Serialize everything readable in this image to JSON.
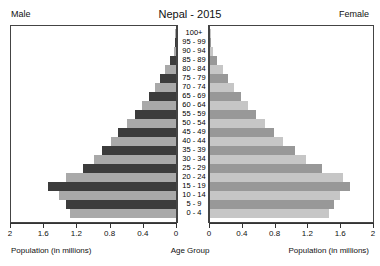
{
  "header": {
    "title": "Nepal - 2015",
    "male_label": "Male",
    "female_label": "Female"
  },
  "axis": {
    "left_title": "Population (in millions)",
    "center_title": "Age Group",
    "right_title": "Population (in millions)",
    "ticks": [
      "2",
      "1.6",
      "1.2",
      "0.8",
      "0.4",
      "0"
    ],
    "ticks_right": [
      "0",
      "0.4",
      "0.8",
      "1.2",
      "1.6",
      "2"
    ]
  },
  "colors": {
    "male_dark": "#3c3c3c",
    "male_light": "#a9a9a9",
    "female_dark": "#989898",
    "female_light": "#c6c6c6",
    "frame": "#444444",
    "background": "#ffffff"
  },
  "chart_data": {
    "type": "bar",
    "title": "Nepal - 2015",
    "subtitle": "",
    "xlabel": "Population (in millions)",
    "ylabel": "Age Group",
    "xlim": [
      0,
      2
    ],
    "grid": false,
    "legend": [
      "Male",
      "Female"
    ],
    "legend_position": "top-left and top-right",
    "orientation": "horizontal-pyramid",
    "categories": [
      "100+",
      "95 - 99",
      "90 - 94",
      "85 - 89",
      "80 - 84",
      "75 - 79",
      "70 - 74",
      "65 - 69",
      "60 - 64",
      "55 - 59",
      "50 - 54",
      "45 - 49",
      "40 - 44",
      "35 - 39",
      "30 - 34",
      "25 - 29",
      "20 - 24",
      "15 - 19",
      "10 - 14",
      "5 - 9",
      "0 - 4"
    ],
    "series": [
      {
        "name": "Male",
        "values": [
          0.003,
          0.01,
          0.03,
          0.07,
          0.13,
          0.19,
          0.26,
          0.33,
          0.41,
          0.5,
          0.6,
          0.7,
          0.79,
          0.9,
          1.0,
          1.13,
          1.33,
          1.55,
          1.42,
          1.33,
          1.29
        ]
      },
      {
        "name": "Female",
        "values": [
          0.004,
          0.013,
          0.04,
          0.09,
          0.16,
          0.22,
          0.3,
          0.38,
          0.47,
          0.57,
          0.68,
          0.79,
          0.89,
          1.04,
          1.18,
          1.38,
          1.63,
          1.72,
          1.6,
          1.52,
          1.46
        ]
      }
    ]
  }
}
